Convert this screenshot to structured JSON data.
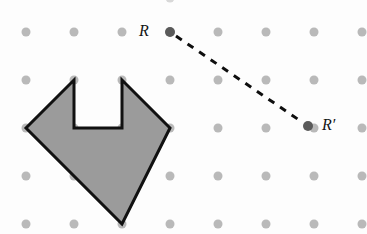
{
  "figure": {
    "width": 367,
    "height": 234,
    "background_color": "#fdfdfd"
  },
  "grid": {
    "name": "dot-grid",
    "origin_x": 26,
    "origin_y": 32,
    "spacing": 48,
    "columns": 8,
    "rows": 5,
    "dot_radius": 4.5,
    "dot_color": "#b9b9b9",
    "partial_top_dot": {
      "x": 170,
      "y": -2,
      "color": "#d8d8d8"
    }
  },
  "polygon": {
    "name": "concave-arrow-polygon",
    "fill_color": "#9b9b9b",
    "stroke_color": "#111111",
    "stroke_width": 3,
    "vertices": [
      {
        "x": 74,
        "y": 80
      },
      {
        "x": 74,
        "y": 128
      },
      {
        "x": 122,
        "y": 128
      },
      {
        "x": 122,
        "y": 80
      },
      {
        "x": 170,
        "y": 128
      },
      {
        "x": 122,
        "y": 224
      },
      {
        "x": 26,
        "y": 128
      }
    ],
    "points_string": "74,80 74,128 122,128 122,80 170,128 122,224 26,128"
  },
  "points": {
    "r": {
      "name": "point-R",
      "label": "R",
      "x": 170,
      "y": 32,
      "label_x": 144,
      "label_y": 32,
      "radius": 5,
      "color": "#5a5a5a"
    },
    "r_prime": {
      "name": "point-R-prime",
      "label": "R′",
      "x": 308,
      "y": 126,
      "label_x": 322,
      "label_y": 126,
      "radius": 5,
      "color": "#5a5a5a"
    }
  },
  "connector": {
    "name": "dashed-translation-vector",
    "from_x": 176,
    "from_y": 36,
    "to_x": 302,
    "to_y": 122,
    "color": "#0e0e0e",
    "stroke_width": 3,
    "dash_pattern": "7 7"
  }
}
